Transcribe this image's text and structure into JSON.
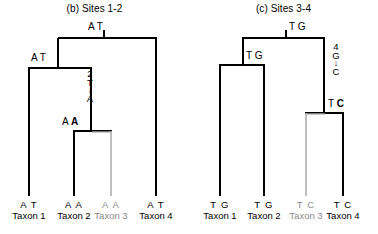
{
  "figure": {
    "panels": [
      {
        "id": "b",
        "title": "(b) Sites 1-2",
        "root_state": "A T",
        "internal_states": [
          {
            "name": "node-ancestor-12",
            "text": "A T"
          },
          {
            "name": "node-ancestor-23",
            "text_plain": "A ",
            "text_bold": "A"
          }
        ],
        "mutation": {
          "site": "2",
          "from": "T",
          "arrow": "↓",
          "to": "A"
        },
        "tips": [
          {
            "state": "A T",
            "name": "Taxon 1",
            "color": "#000000"
          },
          {
            "state": "A A",
            "name": "Taxon 2",
            "color": "#000000"
          },
          {
            "state": "A A",
            "name": "Taxon 3",
            "color": "#b0b0b0"
          },
          {
            "state": "A T",
            "name": "Taxon 4",
            "color": "#000000"
          }
        ]
      },
      {
        "id": "c",
        "title": "(c) Sites 3-4",
        "root_state": "T G",
        "internal_states": [
          {
            "name": "node-ancestor-12",
            "text": "T G"
          },
          {
            "name": "node-ancestor-34",
            "text_plain": "T ",
            "text_bold": "C"
          }
        ],
        "mutation": {
          "site": "4",
          "from": "G",
          "arrow": "↓",
          "to": "C"
        },
        "tips": [
          {
            "state": "T G",
            "name": "Taxon 1",
            "color": "#000000"
          },
          {
            "state": "T G",
            "name": "Taxon 2",
            "color": "#000000"
          },
          {
            "state": "T C",
            "name": "Taxon 3",
            "color": "#b0b0b0"
          },
          {
            "state": "T C",
            "name": "Taxon 4",
            "color": "#000000"
          }
        ]
      }
    ],
    "colors": {
      "line": "#000000",
      "line_faded": "#b0b0b0",
      "background": "#ffffff"
    }
  }
}
